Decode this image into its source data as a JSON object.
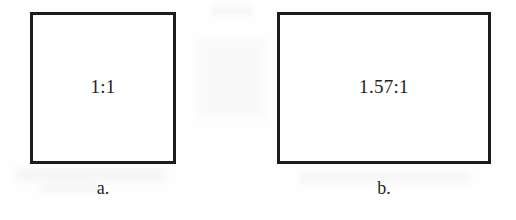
{
  "figure": {
    "type": "aspect-ratio-comparison",
    "background_color": "#fefefe",
    "stroke_color": "#1c1c1c",
    "text_color": "#232323",
    "shapes": [
      {
        "id": "square",
        "ratio_label": "1:1",
        "caption": "a.",
        "shape": "square",
        "width_px": 146,
        "height_px": 152,
        "aspect_ratio_numeric": 1.0
      },
      {
        "id": "wide",
        "ratio_label": "1.57:1",
        "caption": "b.",
        "shape": "rectangle",
        "width_px": 214,
        "height_px": 152,
        "aspect_ratio_numeric": 1.57
      }
    ]
  }
}
